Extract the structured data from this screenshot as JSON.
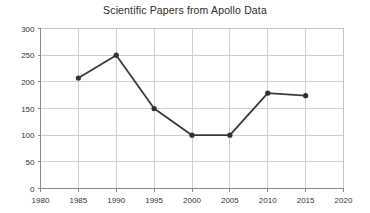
{
  "chart_data": {
    "type": "line",
    "title": "Scientific Papers from Apollo Data",
    "xlabel": "",
    "ylabel": "",
    "x": [
      1985,
      1990,
      1995,
      2000,
      2005,
      2010,
      2015
    ],
    "values": [
      207,
      250,
      150,
      100,
      100,
      179,
      174
    ],
    "series": [
      {
        "name": "Scientific Papers",
        "values": [
          207,
          250,
          150,
          100,
          100,
          179,
          174
        ]
      }
    ],
    "xlim": [
      1980,
      2020
    ],
    "ylim": [
      0,
      300
    ],
    "x_ticks": [
      1980,
      1985,
      1990,
      1995,
      2000,
      2005,
      2010,
      2015,
      2020
    ],
    "y_ticks": [
      0,
      50,
      100,
      150,
      200,
      250,
      300
    ],
    "grid": true,
    "legend": "none",
    "marker": "circle",
    "colors": {
      "line": "#3a3a3a",
      "marker": "#303030",
      "grid": "#cfcfcf",
      "frame": "#c4c4c4",
      "axis": "#8a8a8a",
      "text": "#333333",
      "title": "#2b2b2b",
      "background": "#ffffff"
    }
  }
}
